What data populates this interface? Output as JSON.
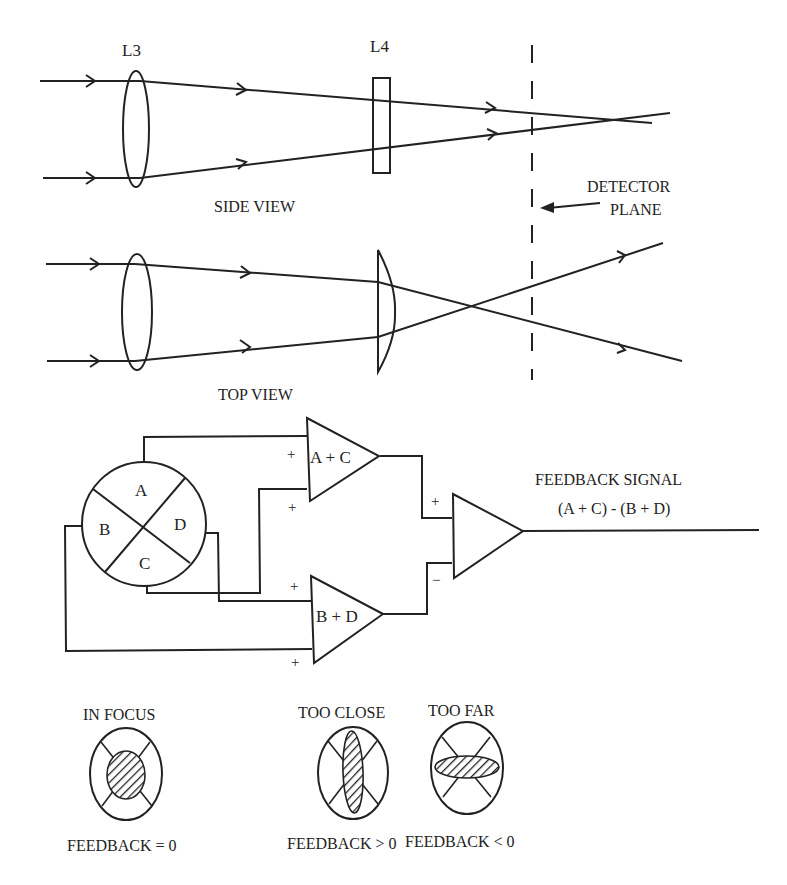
{
  "side_view": {
    "title": "SIDE VIEW",
    "lens_l3_label": "L3",
    "lens_l4_label": "L4",
    "detector_label_line1": "DETECTOR",
    "detector_label_line2": "PLANE"
  },
  "top_view": {
    "title": "TOP VIEW"
  },
  "circuit": {
    "quadrants": {
      "a": "A",
      "b": "B",
      "c": "C",
      "d": "D"
    },
    "amp_top_label": "A + C",
    "amp_bottom_label": "B + D",
    "plus": "+",
    "minus": "−",
    "output_label_line1": "FEEDBACK SIGNAL",
    "output_label_line2": "(A + C) - (B + D)"
  },
  "focus_states": [
    {
      "title": "IN FOCUS",
      "caption": "FEEDBACK = 0",
      "spot": "circle"
    },
    {
      "title": "TOO CLOSE",
      "caption": "FEEDBACK > 0",
      "spot": "vertical-ellipse"
    },
    {
      "title": "TOO FAR",
      "caption": "FEEDBACK < 0",
      "spot": "horizontal-ellipse"
    }
  ],
  "colors": {
    "ink": "#222222",
    "background": "#ffffff"
  }
}
